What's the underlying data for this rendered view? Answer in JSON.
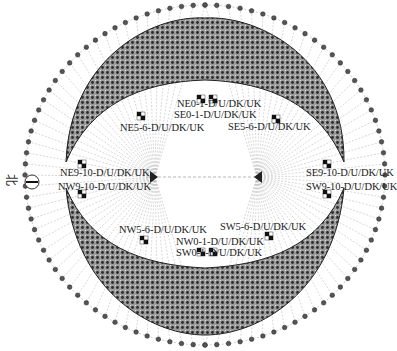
{
  "north_marker": {
    "char": "北",
    "icon": "compass-north-icon"
  },
  "upper_labels": {
    "ne01": "NE0-1-D/U/DK/UK",
    "se01": "SE0-1-D/U/DK/UK",
    "ne56": "NE5-6-D/U/DK/UK",
    "se56": "SE5-6-D/U/DK/UK",
    "ne910": "NE9-10-D/U/DK/UK",
    "se910": "SE9-10-D/U/DK/UK"
  },
  "lower_labels": {
    "nw910": "NW9-10-D/U/DK/UK",
    "sw910": "SW9-10-D/U/DK/UK",
    "nw56": "NW5-6-D/U/DK/UK",
    "sw56": "SW5-6-D/U/DK/UK",
    "nw01": "NW0-1-D/U/DK/UK",
    "sw01": "SW0-1-D/U/DK/UK"
  },
  "colors": {
    "ring_fill": "#6e6e6e",
    "ring_dots": "#2b2b2b",
    "lines": "#9a9a9a",
    "marker": "#111111"
  }
}
